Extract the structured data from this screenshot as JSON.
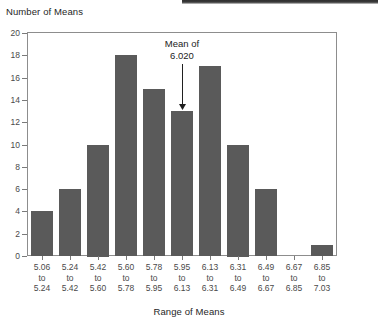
{
  "chart_data": {
    "type": "bar",
    "title": "",
    "xlabel": "Range of Means",
    "ylabel": "Number of Means",
    "categories": [
      "5.06 to 5.24",
      "5.24 to 5.42",
      "5.42 to 5.60",
      "5.60 to 5.78",
      "5.78 to 5.95",
      "5.95 to 6.13",
      "6.13 to 6.31",
      "6.31 to 6.49",
      "6.49 to 6.67",
      "6.67 to 6.85",
      "6.85 to 7.03"
    ],
    "category_lines": [
      [
        "5.06",
        "to",
        "5.24"
      ],
      [
        "5.24",
        "to",
        "5.42"
      ],
      [
        "5.42",
        "to",
        "5.60"
      ],
      [
        "5.60",
        "to",
        "5.78"
      ],
      [
        "5.78",
        "to",
        "5.95"
      ],
      [
        "5.95",
        "to",
        "6.13"
      ],
      [
        "6.13",
        "to",
        "6.31"
      ],
      [
        "6.31",
        "to",
        "6.49"
      ],
      [
        "6.49",
        "to",
        "6.67"
      ],
      [
        "6.67",
        "to",
        "6.85"
      ],
      [
        "6.85",
        "to",
        "7.03"
      ]
    ],
    "values": [
      4,
      6,
      10,
      18,
      15,
      13,
      17,
      10,
      6,
      0,
      1
    ],
    "ylim": [
      0,
      20
    ],
    "yticks": [
      0,
      2,
      4,
      6,
      8,
      10,
      12,
      14,
      16,
      18,
      20
    ],
    "grid": false,
    "legend": "none",
    "bar_color": "#5a5a5a",
    "frame_color": "#8d8d8d",
    "annotations": [
      {
        "name": "mean-marker",
        "line1": "Mean of",
        "line2": "6.020",
        "target_category_index": 5,
        "target_value": 13
      }
    ]
  },
  "axis": {
    "y_title": "Number of Means",
    "x_title": "Range of Means"
  }
}
